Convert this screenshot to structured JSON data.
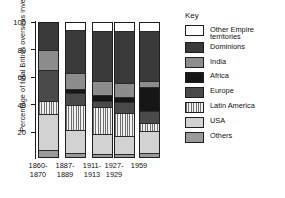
{
  "chart_data": {
    "type": "bar",
    "subtype": "stacked-percentage",
    "title": "",
    "xlabel": "",
    "ylabel": "Percentage of total British overseas investments",
    "ylim": [
      0,
      100
    ],
    "yticks": [
      0,
      20,
      40,
      60,
      80,
      100
    ],
    "ytick_labels": [
      "",
      "20",
      "40",
      "60",
      "80",
      "100"
    ],
    "grid": false,
    "legend_position": "right",
    "legend_title": "Key",
    "categories": [
      "1860-1870",
      "1887-1889",
      "1911-1913",
      "1927-1929",
      "1959"
    ],
    "category_lines": [
      [
        "1860-",
        "1870"
      ],
      [
        "1887-",
        "1889"
      ],
      [
        "1911-",
        "1913"
      ],
      [
        "1927-",
        "1929"
      ],
      [
        "1959",
        ""
      ]
    ],
    "series": [
      {
        "name": "Other Empire territories",
        "color": "#ffffff",
        "fill": "solid",
        "values": [
          0,
          5,
          6,
          6,
          6
        ]
      },
      {
        "name": "Dominions",
        "color": "#3a3a3a",
        "fill": "solid",
        "values": [
          20,
          32,
          37,
          39,
          37
        ]
      },
      {
        "name": "India",
        "color": "#8d8d8d",
        "fill": "solid",
        "values": [
          15,
          12,
          11,
          10,
          5
        ]
      },
      {
        "name": "Africa",
        "color": "#161616",
        "fill": "solid",
        "values": [
          0,
          3,
          4,
          4,
          18
        ]
      },
      {
        "name": "Europe",
        "color": "#4a4a4a",
        "fill": "solid",
        "values": [
          23,
          9,
          5,
          8,
          9
        ]
      },
      {
        "name": "Latin America",
        "color": "#6f6f6f",
        "fill": "vertical-stripes",
        "values": [
          10,
          19,
          20,
          17,
          6
        ]
      },
      {
        "name": "USA",
        "color": "#d2d2d2",
        "fill": "solid",
        "values": [
          27,
          17,
          15,
          14,
          16
        ]
      },
      {
        "name": "Others",
        "color": "#9a9a9a",
        "fill": "solid",
        "values": [
          5,
          3,
          2,
          2,
          3
        ]
      }
    ]
  },
  "axis": {
    "y_title": "Percentage of total British overseas investments",
    "tick_100": "100",
    "tick_80": "80",
    "tick_60": "60",
    "tick_40": "40",
    "tick_20": "20"
  },
  "legend": {
    "title": "Key",
    "items": [
      {
        "label": "Other Empire\nterritories",
        "key": "other-empire"
      },
      {
        "label": "Dominions",
        "key": "dominions"
      },
      {
        "label": "India",
        "key": "india"
      },
      {
        "label": "Africa",
        "key": "africa"
      },
      {
        "label": "Europe",
        "key": "europe"
      },
      {
        "label": "Latin America",
        "key": "latin-america"
      },
      {
        "label": "USA",
        "key": "usa"
      },
      {
        "label": "Others",
        "key": "others"
      }
    ]
  },
  "xlabels": [
    {
      "line1": "1860-",
      "line2": "1870"
    },
    {
      "line1": "1887-",
      "line2": "1889"
    },
    {
      "line1": "1911-",
      "line2": "1913"
    },
    {
      "line1": "1927-",
      "line2": "1929"
    },
    {
      "line1": "1959",
      "line2": ""
    }
  ]
}
